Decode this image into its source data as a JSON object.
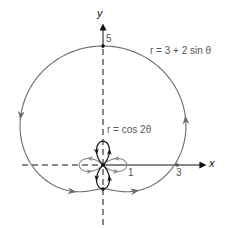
{
  "diagram": {
    "axes": {
      "x_label": "x",
      "y_label": "y"
    },
    "curves": [
      {
        "name": "limacon",
        "equation": "r = 3 + 2 sin θ",
        "color": "#6b6b6b"
      },
      {
        "name": "rose",
        "equation": "r = cos 2θ",
        "color": "#111111"
      }
    ],
    "point_labels": {
      "y_intercept": "5",
      "rose_x": "1",
      "limacon_x": "3"
    },
    "colors": {
      "axis": "#111111",
      "curve_gray": "#6b6b6b",
      "rose_dark": "#111111",
      "rose_gray": "#8a8a8a"
    }
  },
  "chart_data": {
    "type": "line",
    "title": "",
    "xlabel": "x",
    "ylabel": "y",
    "series": [
      {
        "name": "r = 3 + 2 sin θ",
        "polar": true,
        "formula": "3 + 2*sin(t)",
        "theta_range": [
          0,
          6.2832
        ],
        "key_points": [
          [
            3,
            0
          ],
          [
            0,
            5
          ],
          [
            -3,
            0
          ],
          [
            0,
            -1
          ]
        ]
      },
      {
        "name": "r = cos 2θ",
        "polar": true,
        "formula": "cos(2*t)",
        "theta_range": [
          0,
          6.2832
        ],
        "key_points": [
          [
            1,
            0
          ],
          [
            0,
            1
          ],
          [
            -1,
            0
          ],
          [
            0,
            -1
          ]
        ]
      }
    ],
    "annotations": [
      "5",
      "1",
      "3",
      "r = 3 + 2 sin θ",
      "r = cos 2θ"
    ],
    "grid": false
  }
}
